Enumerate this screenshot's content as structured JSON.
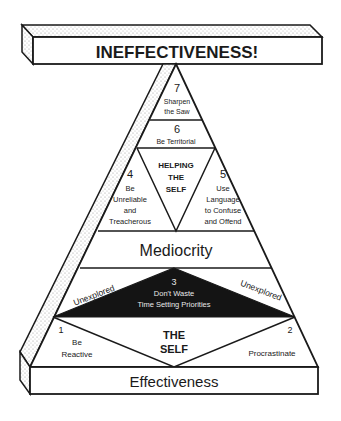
{
  "diagram": {
    "type": "pyramid",
    "top_beam": {
      "label": "INEFFECTIVENESS!"
    },
    "base_beam": {
      "label": "Effectiveness"
    },
    "middle_band": {
      "label": "Mediocrity"
    },
    "levels": [
      {
        "number": "7",
        "lines": [
          "Sharpen",
          "the Saw"
        ]
      },
      {
        "number": "6",
        "lines": [
          "Be Territorial"
        ]
      },
      {
        "number": "5",
        "lines": [
          "Use",
          "Language",
          "to Confuse",
          "and Offend"
        ]
      },
      {
        "number": "4",
        "lines": [
          "Be",
          "Unreliable",
          "and",
          "Treacherous"
        ]
      },
      {
        "number": "3",
        "lines": [
          "Don't Waste",
          "Time Setting Priorities"
        ]
      },
      {
        "number": "2",
        "lines": [
          "Procrastinate"
        ]
      },
      {
        "number": "1",
        "lines": [
          "Be",
          "Reactive"
        ]
      }
    ],
    "helping_the_self": {
      "lines": [
        "HELPING",
        "THE",
        "SELF"
      ]
    },
    "the_self": {
      "lines": [
        "THE",
        "SELF"
      ]
    },
    "side_labels": {
      "left": "Unexplored",
      "right": "Unexplored"
    },
    "colors": {
      "ink": "#1a1a1a",
      "fill": "#ffffff",
      "dark_triangle": "#141414",
      "stipple": "#bdbdbd"
    }
  }
}
